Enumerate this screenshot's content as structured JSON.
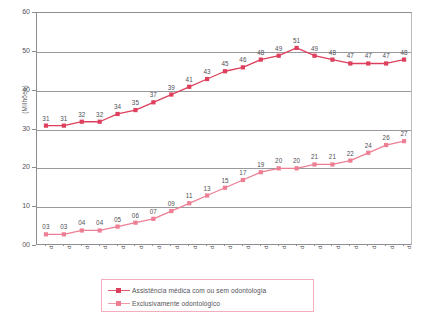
{
  "chart_data": {
    "type": "line",
    "title": "",
    "xlabel": "",
    "ylabel": "(Milhões)",
    "ylim": [
      0,
      60
    ],
    "ytick_labels": [
      "60",
      "50",
      "40",
      "30",
      "20",
      "10",
      "00"
    ],
    "ytick_values": [
      60,
      50,
      40,
      30,
      20,
      10,
      0
    ],
    "grid": true,
    "legend_position": "bottom",
    "categories": [
      "dez/00",
      "dez/01",
      "dez/02",
      "dez/03",
      "dez/04",
      "dez/05",
      "dez/06",
      "dez/07",
      "dez/08",
      "dez/09",
      "dez/10",
      "dez/11",
      "dez/12",
      "dez/13",
      "dez/14",
      "dez/15",
      "dez/16",
      "dez/17",
      "dez/18",
      "dez/19",
      "dez/20"
    ],
    "series": [
      {
        "name": "Assistência médica com ou sem odontologia",
        "color": "#dd3f5c",
        "values": [
          31,
          31,
          32,
          32,
          34,
          35,
          37,
          39,
          41,
          43,
          45,
          46,
          48,
          49,
          51,
          49,
          48,
          47,
          47,
          47,
          48
        ],
        "labels": [
          "31",
          "31",
          "32",
          "32",
          "34",
          "35",
          "37",
          "39",
          "41",
          "43",
          "45",
          "46",
          "48",
          "49",
          "51",
          "49",
          "48",
          "47",
          "47",
          "47",
          "48"
        ]
      },
      {
        "name": "Exclusivamente odontológico",
        "color": "#ee7e93",
        "values": [
          3,
          3,
          4,
          4,
          5,
          6,
          7,
          9,
          11,
          13,
          15,
          17,
          19,
          20,
          20,
          21,
          21,
          22,
          24,
          26,
          27
        ],
        "labels": [
          "03",
          "03",
          "04",
          "04",
          "05",
          "06",
          "07",
          "09",
          "11",
          "13",
          "15",
          "17",
          "19",
          "20",
          "20",
          "21",
          "21",
          "22",
          "24",
          "26",
          "27"
        ]
      }
    ]
  },
  "legend": {
    "items": [
      {
        "label": "Assistência médica com ou sem odontologia"
      },
      {
        "label": "Exclusivamente odontológico"
      }
    ]
  }
}
